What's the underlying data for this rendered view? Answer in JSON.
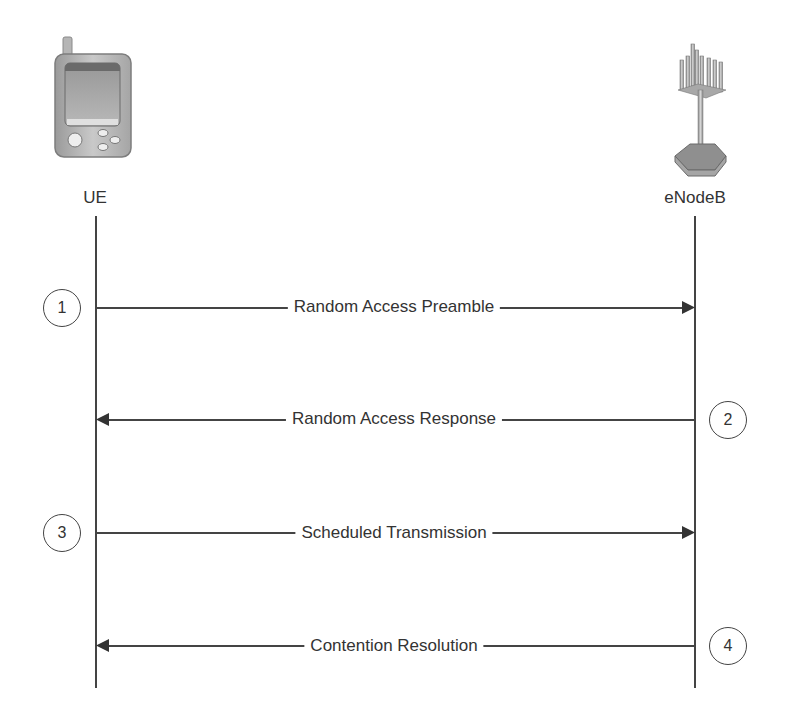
{
  "entities": {
    "ue": {
      "label": "UE",
      "icon": "mobile-phone-icon"
    },
    "enodeb": {
      "label": "eNodeB",
      "icon": "antenna-tower-icon"
    }
  },
  "messages": [
    {
      "step": "1",
      "label": "Random Access Preamble",
      "direction": "UE->eNodeB"
    },
    {
      "step": "2",
      "label": "Random Access Response",
      "direction": "eNodeB->UE"
    },
    {
      "step": "3",
      "label": "Scheduled Transmission",
      "direction": "UE->eNodeB"
    },
    {
      "step": "4",
      "label": "Contention Resolution",
      "direction": "eNodeB->UE"
    }
  ],
  "colors": {
    "line": "#444444",
    "text": "#333333",
    "background": "#ffffff"
  }
}
